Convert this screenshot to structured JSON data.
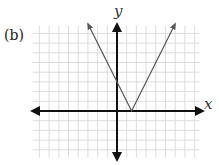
{
  "panel_label": "(b)",
  "axes": {
    "x_label": "x",
    "y_label": "y"
  },
  "colors": {
    "grid": "#d4d4d4",
    "axis": "#111111",
    "curve": "#555555"
  },
  "chart_data": {
    "type": "line",
    "title": "(b)",
    "xlabel": "x",
    "ylabel": "y",
    "function": "y = 2|x - 1.5|",
    "series": [
      {
        "name": "V-shaped absolute value graph",
        "x": [
          -3,
          1.5,
          6
        ],
        "y": [
          9,
          0,
          9
        ]
      }
    ],
    "key_points": {
      "vertex": [
        1.5,
        0
      ],
      "y_intercept": [
        0,
        3
      ]
    },
    "xlim": [
      -8.7,
      8.5
    ],
    "ylim": [
      -4.8,
      8.8
    ],
    "grid": true,
    "grid_step": 1,
    "tick_labels": false,
    "legend": null
  }
}
